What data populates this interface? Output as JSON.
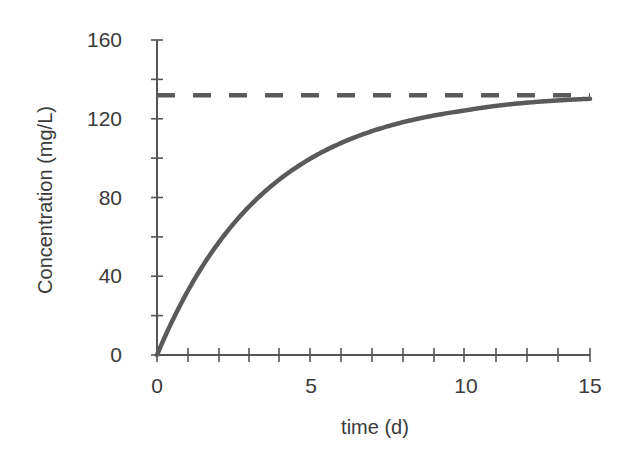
{
  "chart_data": {
    "type": "line",
    "title": "",
    "xlabel": "time (d)",
    "ylabel": "Concentration (mg/L)",
    "xlim": [
      0,
      15
    ],
    "ylim": [
      0,
      160
    ],
    "x_major_ticks": [
      0,
      5,
      10,
      15
    ],
    "x_tick_labels": [
      "0",
      "5",
      "10",
      "15"
    ],
    "x_minor_tick_step": 1,
    "y_major_ticks": [
      0,
      40,
      80,
      120,
      160
    ],
    "y_tick_labels": [
      "0",
      "40",
      "80",
      "120",
      "160"
    ],
    "y_minor_tick_step": 20,
    "grid": false,
    "legend": null,
    "series": [
      {
        "name": "concentration",
        "style": "solid",
        "color": "#555555",
        "model": "C = 132 * (1 - exp(-0.284 * t))",
        "x": [
          0,
          1,
          2,
          3,
          4,
          5,
          6,
          7,
          8,
          9,
          10,
          11,
          12,
          13,
          14,
          15
        ],
        "y": [
          0,
          32.7,
          57.3,
          75.9,
          89.9,
          100.4,
          108.4,
          114.4,
          118.9,
          122.3,
          124.4,
          126.8,
          128.3,
          129.4,
          130.1,
          130.6
        ]
      },
      {
        "name": "asymptote",
        "style": "dashed",
        "color": "#555555",
        "x": [
          0,
          15
        ],
        "y": [
          132,
          132
        ]
      }
    ]
  },
  "axes": {
    "x_title": "time (d)",
    "y_title": "Concentration (mg/L)",
    "x_labels": [
      "0",
      "5",
      "10",
      "15"
    ],
    "y_labels": [
      "0",
      "40",
      "80",
      "120",
      "160"
    ]
  }
}
